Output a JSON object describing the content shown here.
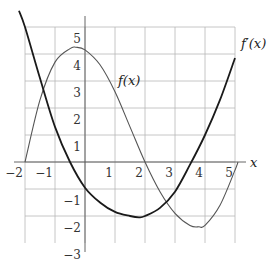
{
  "chart_data": {
    "type": "line",
    "title": "",
    "xlabel": "x",
    "ylabel": "",
    "xlim": [
      -2,
      5
    ],
    "ylim": [
      -3,
      5
    ],
    "grid": true,
    "x_ticks": [
      "-2",
      "-1",
      "1",
      "2",
      "3",
      "4",
      "5"
    ],
    "y_ticks": [
      "5",
      "4",
      "3",
      "2",
      "1",
      "-1",
      "-2",
      "-3"
    ],
    "series": [
      {
        "name": "f(x)",
        "style": "thin",
        "x": [
          -2.0,
          -1.5,
          -1.0,
          -0.5,
          -0.3,
          0.0,
          0.5,
          1.0,
          1.5,
          2.0,
          2.5,
          3.0,
          3.5,
          3.8,
          4.0,
          4.5,
          5.0,
          5.1
        ],
        "y": [
          0.0,
          2.3,
          3.7,
          4.2,
          4.25,
          4.15,
          3.6,
          2.6,
          1.3,
          0.0,
          -1.1,
          -1.9,
          -2.35,
          -2.4,
          -2.35,
          -1.6,
          -0.3,
          0.0
        ]
      },
      {
        "name": "f'(x)",
        "style": "thick",
        "x": [
          -2.2,
          -2.0,
          -1.5,
          -1.0,
          -0.5,
          0.0,
          0.5,
          1.0,
          1.5,
          1.8,
          2.0,
          2.5,
          3.0,
          3.5,
          4.0,
          4.5,
          5.0
        ],
        "y": [
          5.6,
          5.0,
          3.1,
          1.3,
          0.0,
          -0.95,
          -1.5,
          -1.85,
          -2.0,
          -2.05,
          -2.0,
          -1.7,
          -1.1,
          -0.1,
          1.0,
          2.3,
          3.85
        ]
      }
    ],
    "annotations": [
      {
        "text": "f(x)",
        "x": 1.5,
        "y": 3.0
      },
      {
        "text": "f'(x)",
        "x": 5.6,
        "y": 4.3
      }
    ]
  },
  "labels": {
    "x_axis": "x",
    "f": "f(x)",
    "fprime": "f′(x)"
  }
}
